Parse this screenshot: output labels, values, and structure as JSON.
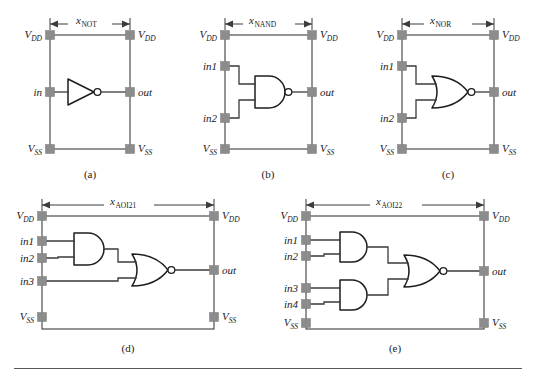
{
  "figure": {
    "background_color": "#ffffff",
    "line_color": "#3a3a3a",
    "pin_color": "#8c8c8c",
    "gate_fill": "#ffffff"
  },
  "common_labels": {
    "vdd": "V",
    "vdd_sub": "DD",
    "vss": "V",
    "vss_sub": "SS",
    "out": "out",
    "dim_symbol": "x"
  },
  "panels": [
    {
      "id": "not",
      "caption": "(a)",
      "dim_symbol": "x",
      "dim_subscript": "NOT",
      "gate_type": "inverter",
      "inputs": [
        "in"
      ],
      "output": "out",
      "left_pins": [
        "V",
        "in",
        "V"
      ],
      "left_pin_subs": [
        "DD",
        "",
        "SS"
      ],
      "right_pins": [
        "V",
        "out",
        "V"
      ],
      "right_pin_subs": [
        "DD",
        "",
        "SS"
      ],
      "gates": [
        "NOT"
      ]
    },
    {
      "id": "nand",
      "caption": "(b)",
      "dim_symbol": "x",
      "dim_subscript": "NAND",
      "gate_type": "nand2",
      "inputs": [
        "in1",
        "in2"
      ],
      "output": "out",
      "left_pins": [
        "V",
        "in1",
        "in2",
        "V"
      ],
      "left_pin_subs": [
        "DD",
        "",
        "",
        "SS"
      ],
      "right_pins": [
        "V",
        "out",
        "V"
      ],
      "right_pin_subs": [
        "DD",
        "",
        "SS"
      ],
      "gates": [
        "NAND"
      ]
    },
    {
      "id": "nor",
      "caption": "(c)",
      "dim_symbol": "x",
      "dim_subscript": "NOR",
      "gate_type": "nor2",
      "inputs": [
        "in1",
        "in2"
      ],
      "output": "out",
      "left_pins": [
        "V",
        "in1",
        "in2",
        "V"
      ],
      "left_pin_subs": [
        "DD",
        "",
        "",
        "SS"
      ],
      "right_pins": [
        "V",
        "out",
        "V"
      ],
      "right_pin_subs": [
        "DD",
        "",
        "SS"
      ],
      "gates": [
        "NOR"
      ]
    },
    {
      "id": "aoi21",
      "caption": "(d)",
      "dim_symbol": "x",
      "dim_subscript": "AOI21",
      "gate_type": "aoi21",
      "inputs": [
        "in1",
        "in2",
        "in3"
      ],
      "output": "out",
      "left_pins": [
        "V",
        "in1",
        "in2",
        "in3",
        "V"
      ],
      "left_pin_subs": [
        "DD",
        "",
        "",
        "",
        "SS"
      ],
      "right_pins": [
        "V",
        "out",
        "V"
      ],
      "right_pin_subs": [
        "DD",
        "",
        "SS"
      ],
      "gates": [
        "AND",
        "NOR"
      ]
    },
    {
      "id": "aoi22",
      "caption": "(e)",
      "dim_symbol": "x",
      "dim_subscript": "AOI22",
      "gate_type": "aoi22",
      "inputs": [
        "in1",
        "in2",
        "in3",
        "in4"
      ],
      "output": "out",
      "left_pins": [
        "V",
        "in1",
        "in2",
        "in3",
        "in4",
        "V"
      ],
      "left_pin_subs": [
        "DD",
        "",
        "",
        "",
        "",
        "SS"
      ],
      "right_pins": [
        "V",
        "out",
        "V"
      ],
      "right_pin_subs": [
        "DD",
        "",
        "SS"
      ],
      "gates": [
        "AND",
        "AND",
        "NOR"
      ]
    }
  ]
}
